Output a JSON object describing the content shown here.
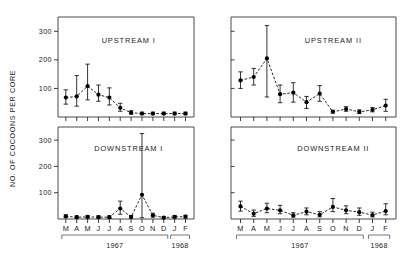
{
  "figure": {
    "ylabel": "NO. OF COCOONS PER CORE",
    "y_ticks": [
      "100",
      "200",
      "300"
    ],
    "y_tick_values": [
      100,
      200,
      300
    ],
    "ylim": [
      0,
      350
    ],
    "months": [
      "M",
      "A",
      "M",
      "J",
      "J",
      "A",
      "S",
      "O",
      "N",
      "D",
      "J",
      "F"
    ],
    "year_labels": [
      "1967",
      "1968"
    ],
    "year_spans": [
      [
        0,
        9
      ],
      [
        10,
        11
      ]
    ],
    "grid": false,
    "legend": "none"
  },
  "chart_data": [
    {
      "type": "line",
      "title": "UPSTREAM I",
      "panel": "top-left",
      "xlabel": "",
      "ylabel": "NO. OF COCOONS PER CORE",
      "ylim": [
        0,
        350
      ],
      "categories": [
        "M",
        "A",
        "M",
        "J",
        "J",
        "A",
        "S",
        "O",
        "N",
        "D",
        "J",
        "F"
      ],
      "x_note": "Mar 1967 - Feb 1968",
      "values": [
        68,
        72,
        108,
        78,
        68,
        32,
        15,
        12,
        12,
        12,
        12,
        12
      ],
      "err_lo": [
        45,
        38,
        60,
        55,
        42,
        20,
        10,
        8,
        8,
        8,
        8,
        8
      ],
      "err_hi": [
        95,
        145,
        185,
        112,
        102,
        48,
        22,
        17,
        17,
        17,
        17,
        17
      ]
    },
    {
      "type": "line",
      "title": "UPSTREAM II",
      "panel": "top-right",
      "xlabel": "",
      "ylabel": "NO. OF COCOONS PER CORE",
      "ylim": [
        0,
        350
      ],
      "categories": [
        "M",
        "A",
        "M",
        "J",
        "J",
        "A",
        "S",
        "O",
        "N",
        "D",
        "J",
        "F"
      ],
      "x_note": "Mar 1967 - Feb 1968",
      "values": [
        128,
        140,
        205,
        80,
        85,
        52,
        82,
        18,
        28,
        18,
        25,
        40
      ],
      "err_lo": [
        100,
        112,
        70,
        50,
        52,
        30,
        55,
        14,
        20,
        12,
        18,
        20
      ],
      "err_hi": [
        158,
        170,
        320,
        112,
        120,
        72,
        110,
        24,
        36,
        25,
        33,
        62
      ]
    },
    {
      "type": "line",
      "title": "DOWNSTREAM I",
      "panel": "bottom-left",
      "xlabel": "",
      "ylabel": "NO. OF COCOONS PER CORE",
      "ylim": [
        0,
        350
      ],
      "categories": [
        "M",
        "A",
        "M",
        "J",
        "J",
        "A",
        "S",
        "O",
        "N",
        "D",
        "J",
        "F"
      ],
      "x_note": "Mar 1967 - Feb 1968",
      "values": [
        10,
        7,
        8,
        7,
        7,
        40,
        8,
        92,
        14,
        5,
        8,
        9
      ],
      "err_lo": [
        5,
        3,
        4,
        3,
        3,
        18,
        4,
        5,
        7,
        2,
        4,
        4
      ],
      "err_hi": [
        16,
        12,
        13,
        12,
        12,
        68,
        13,
        325,
        22,
        9,
        13,
        14
      ]
    },
    {
      "type": "line",
      "title": "DOWNSTREAM II",
      "panel": "bottom-right",
      "xlabel": "",
      "ylabel": "NO. OF COCOONS PER CORE",
      "ylim": [
        0,
        350
      ],
      "categories": [
        "M",
        "A",
        "M",
        "J",
        "J",
        "A",
        "S",
        "O",
        "N",
        "D",
        "J",
        "F"
      ],
      "x_note": "Mar 1967 - Feb 1968",
      "values": [
        48,
        20,
        40,
        33,
        14,
        28,
        16,
        46,
        33,
        26,
        15,
        30
      ],
      "err_lo": [
        30,
        10,
        24,
        20,
        7,
        16,
        8,
        28,
        20,
        14,
        8,
        16
      ],
      "err_hi": [
        68,
        34,
        60,
        52,
        24,
        42,
        28,
        78,
        50,
        42,
        26,
        58
      ]
    }
  ]
}
